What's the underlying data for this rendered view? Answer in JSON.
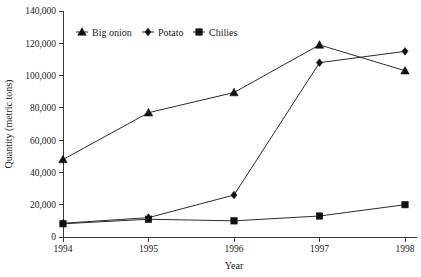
{
  "chart_data": {
    "type": "line",
    "title": "",
    "subtitle": "",
    "xlabel": "Year",
    "ylabel": "Quantity (metric tons)",
    "categories": [
      "1994",
      "1995",
      "1996",
      "1997",
      "1998"
    ],
    "x": [
      1994,
      1995,
      1996,
      1997,
      1998
    ],
    "xlim": [
      1994,
      1998
    ],
    "ylim": [
      0,
      140000
    ],
    "ytick_values": [
      0,
      20000,
      40000,
      60000,
      80000,
      100000,
      120000,
      140000
    ],
    "ytick_labels": [
      "0",
      "20,000",
      "40,000",
      "60,000",
      "80,000",
      "100,000",
      "120,000",
      "140,000"
    ],
    "xtick_labels": [
      "1994",
      "1995",
      "1996",
      "1997",
      "1998"
    ],
    "grid": false,
    "legend_position": "top-left-inside",
    "series": [
      {
        "name": "Big onion",
        "marker": "triangle",
        "color": "#111111",
        "values": [
          48000,
          77000,
          89500,
          119000,
          103000
        ]
      },
      {
        "name": "Potato",
        "marker": "diamond",
        "color": "#111111",
        "values": [
          8500,
          12000,
          26000,
          108000,
          115000
        ]
      },
      {
        "name": "Chilies",
        "marker": "square",
        "color": "#111111",
        "values": [
          8200,
          11000,
          10000,
          13000,
          20000
        ]
      }
    ]
  },
  "legend": {
    "items": [
      {
        "label": "Big onion",
        "marker": "triangle-marker-icon"
      },
      {
        "label": "Potato",
        "marker": "diamond-marker-icon"
      },
      {
        "label": "Chilies",
        "marker": "square-marker-icon"
      }
    ]
  },
  "axes": {
    "x_title": "Year",
    "y_title": "Quantity (metric tons)"
  },
  "colors": {
    "ink": "#111111",
    "axis": "#3a3a3a",
    "background": "#ffffff"
  }
}
